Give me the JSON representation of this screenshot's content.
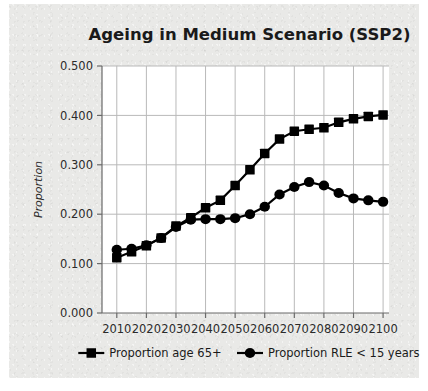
{
  "chart_data": {
    "type": "line",
    "title": "Ageing in Medium Scenario (SSP2)",
    "xlabel": "",
    "ylabel": "Proportion",
    "xlim": [
      2005,
      2102
    ],
    "ylim": [
      0.0,
      0.5
    ],
    "ytick_labels": [
      "0.500",
      "0.400",
      "0.300",
      "0.200",
      "0.100",
      "0.000"
    ],
    "ytick_values": [
      0.5,
      0.4,
      0.3,
      0.2,
      0.1,
      0.0
    ],
    "xtick_labels": [
      "2010",
      "2020",
      "2030",
      "2040",
      "2050",
      "2060",
      "2070",
      "2080",
      "2090",
      "2100"
    ],
    "xtick_values": [
      2010,
      2020,
      2030,
      2040,
      2050,
      2060,
      2070,
      2080,
      2090,
      2100
    ],
    "grid": true,
    "legend_position": "bottom",
    "x": [
      2010,
      2015,
      2020,
      2025,
      2030,
      2035,
      2040,
      2045,
      2050,
      2055,
      2060,
      2065,
      2070,
      2075,
      2080,
      2085,
      2090,
      2095,
      2100
    ],
    "series": [
      {
        "name": "Proportion age 65+",
        "marker": "square",
        "color": "#000000",
        "values": [
          0.112,
          0.124,
          0.136,
          0.152,
          0.176,
          0.193,
          0.213,
          0.228,
          0.258,
          0.29,
          0.323,
          0.352,
          0.368,
          0.372,
          0.375,
          0.386,
          0.393,
          0.398,
          0.401
        ]
      },
      {
        "name": "Proportion RLE < 15 years",
        "marker": "circle",
        "color": "#000000",
        "values": [
          0.128,
          0.13,
          0.137,
          0.152,
          0.174,
          0.189,
          0.19,
          0.19,
          0.192,
          0.2,
          0.215,
          0.24,
          0.255,
          0.265,
          0.258,
          0.243,
          0.232,
          0.228,
          0.225
        ]
      }
    ]
  },
  "legend": {
    "items": [
      {
        "label": "Proportion age 65+",
        "marker": "square"
      },
      {
        "label": "Proportion RLE < 15 years",
        "marker": "circle"
      }
    ]
  },
  "colors": {
    "panel_background": "#e9e9e7",
    "plot_background": "#ffffff",
    "ink": "#000000",
    "gridline": "#b9b9b9",
    "axis": "#6a6a6a"
  }
}
